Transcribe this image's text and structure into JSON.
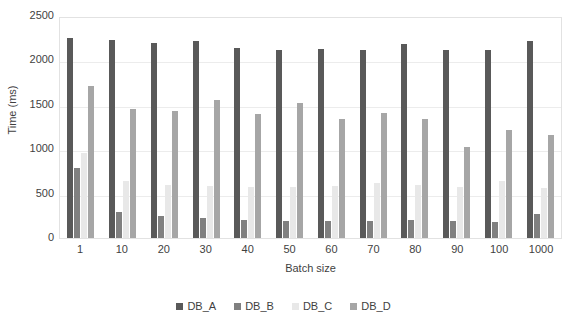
{
  "chart_data": {
    "type": "bar",
    "title": "",
    "xlabel": "Batch size",
    "ylabel": "Time (ms)",
    "categories": [
      "1",
      "10",
      "20",
      "30",
      "40",
      "50",
      "60",
      "70",
      "80",
      "90",
      "100",
      "1000"
    ],
    "ylim": [
      0,
      2500
    ],
    "yticks": [
      0,
      500,
      1000,
      1500,
      2000,
      2500
    ],
    "ytick_labels": [
      "0",
      "500",
      "1000",
      "1500",
      "2000",
      "2500"
    ],
    "grid": true,
    "legend_position": "bottom",
    "series": [
      {
        "name": "DB_A",
        "color": "#595959",
        "values": [
          2255,
          2225,
          2195,
          2215,
          2140,
          2115,
          2125,
          2115,
          2180,
          2120,
          2115,
          2220
        ]
      },
      {
        "name": "DB_B",
        "color": "#808080",
        "values": [
          790,
          295,
          250,
          220,
          205,
          195,
          195,
          190,
          205,
          195,
          180,
          265
        ]
      },
      {
        "name": "DB_C",
        "color": "#e8e8e8",
        "values": [
          955,
          640,
          595,
          585,
          580,
          580,
          585,
          615,
          600,
          580,
          640,
          560
        ]
      },
      {
        "name": "DB_D",
        "color": "#a6a6a6",
        "values": [
          1710,
          1455,
          1430,
          1550,
          1400,
          1520,
          1335,
          1410,
          1335,
          1030,
          1215,
          1155
        ]
      }
    ]
  }
}
